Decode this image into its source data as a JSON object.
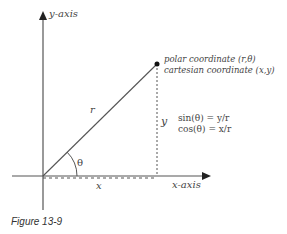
{
  "diagram": {
    "labels": {
      "y_axis": "y-axis",
      "x_axis": "x-axis",
      "r": "r",
      "theta": "θ",
      "x": "x",
      "y": "y",
      "polar": "polar coordinate (r,θ)",
      "cartesian": "cartesian coordinate (x,y)",
      "sin": "sin(θ) = y/r",
      "cos": "cos(θ) = x/r"
    },
    "caption": "Figure 13-9"
  }
}
